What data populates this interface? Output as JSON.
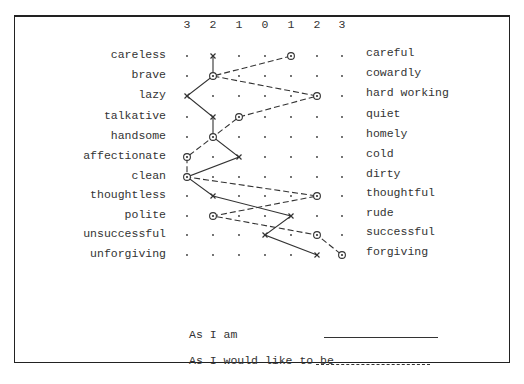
{
  "chart_data": {
    "type": "line",
    "title": "",
    "scale_ticks": [
      "3",
      "2",
      "1",
      "0",
      "1",
      "2",
      "3"
    ],
    "rows": [
      {
        "left": "careless",
        "right": "careful"
      },
      {
        "left": "brave",
        "right": "cowardly"
      },
      {
        "left": "lazy",
        "right": "hard working"
      },
      {
        "left": "talkative",
        "right": "quiet"
      },
      {
        "left": "handsome",
        "right": "homely"
      },
      {
        "left": "affectionate",
        "right": "cold"
      },
      {
        "left": "clean",
        "right": "dirty"
      },
      {
        "left": "thoughtless",
        "right": "thoughtful"
      },
      {
        "left": "polite",
        "right": "rude"
      },
      {
        "left": "unsuccessful",
        "right": "successful"
      },
      {
        "left": "unforgiving",
        "right": "forgiving"
      }
    ],
    "series": [
      {
        "name": "As I am",
        "line_style": "solid",
        "marker": "x",
        "column_index": [
          1,
          1,
          0,
          1,
          1,
          2,
          0,
          1,
          4,
          3,
          5
        ]
      },
      {
        "name": "As I would like to be",
        "line_style": "dashed",
        "marker": "circled-dot",
        "column_index": [
          4,
          1,
          5,
          2,
          1,
          0,
          0,
          5,
          1,
          5,
          6
        ]
      }
    ],
    "legend": [
      {
        "label": "As I am",
        "line_style": "solid"
      },
      {
        "label": "As I would like to be",
        "line_style": "dashed"
      }
    ],
    "grid": "dot-matrix",
    "legend_position": "bottom"
  },
  "layout": {
    "col_x": [
      187,
      213,
      239,
      265,
      291,
      317,
      342
    ],
    "row_y": [
      56,
      76,
      96,
      117,
      137,
      157,
      177,
      196,
      216,
      235,
      255
    ],
    "tick_y": 24,
    "line_color": "#333333"
  },
  "legend": {
    "as_i_am": "As I am",
    "as_i_would_like": "As I would like to be"
  }
}
